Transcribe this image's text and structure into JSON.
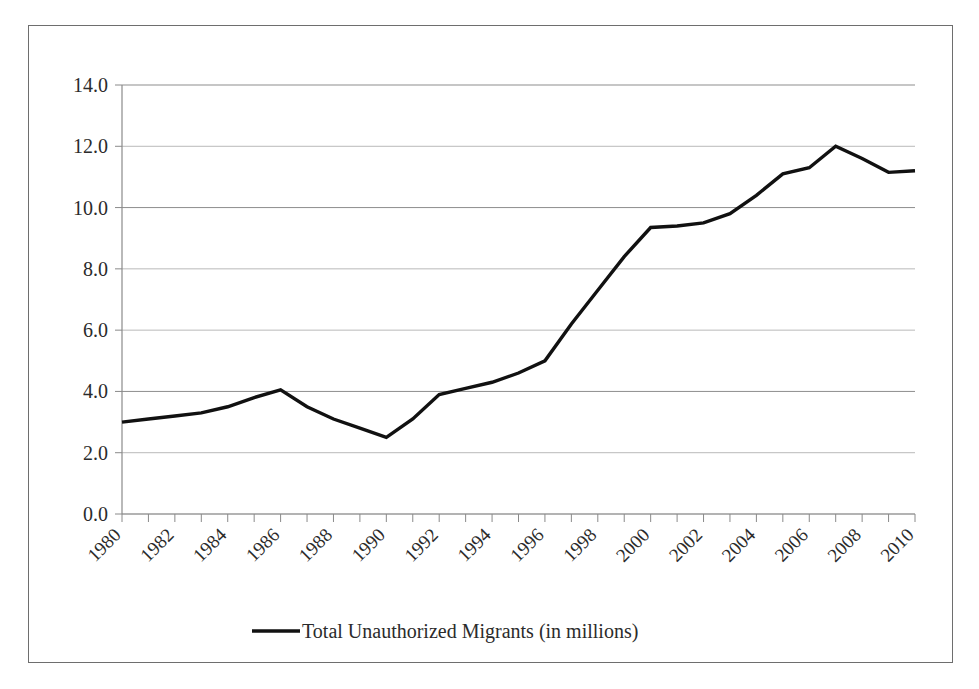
{
  "figure": {
    "background_color": "#ffffff",
    "border_color": "#6e6e6e",
    "line_color": "#111111",
    "gridline_color": "#b9b9b9"
  },
  "legend": {
    "position": "bottom-center",
    "entries": [
      {
        "label": "Total Unauthorized Migrants (in millions)",
        "marker": "line-swatch",
        "color": "#111111"
      }
    ]
  },
  "axes": {
    "y_tick_labels": [
      "0.0",
      "2.0",
      "4.0",
      "6.0",
      "8.0",
      "10.0",
      "12.0",
      "14.0"
    ],
    "x_tick_labels": [
      "1980",
      "1982",
      "1984",
      "1986",
      "1988",
      "1990",
      "1992",
      "1994",
      "1996",
      "1998",
      "2000",
      "2002",
      "2004",
      "2006",
      "2008",
      "2010"
    ]
  },
  "chart_data": {
    "type": "line",
    "title": "",
    "subtitle": "",
    "xlabel": "",
    "ylabel": "",
    "xlim": [
      1980,
      2010
    ],
    "ylim": [
      0.0,
      14.0
    ],
    "y_tick_step": 2.0,
    "x_tick_step_labeled": 2,
    "x_tick_step_minor": 1,
    "grid": true,
    "grid_axis": "y",
    "legend_position": "bottom",
    "x": [
      1980,
      1981,
      1982,
      1983,
      1984,
      1985,
      1986,
      1987,
      1988,
      1989,
      1990,
      1991,
      1992,
      1993,
      1994,
      1995,
      1996,
      1997,
      1998,
      1999,
      2000,
      2001,
      2002,
      2003,
      2004,
      2005,
      2006,
      2007,
      2008,
      2009,
      2010
    ],
    "series": [
      {
        "name": "Total Unauthorized Migrants (in millions)",
        "color": "#111111",
        "values": [
          3.0,
          3.1,
          3.2,
          3.3,
          3.5,
          3.8,
          4.05,
          3.5,
          3.1,
          2.8,
          2.5,
          3.1,
          3.9,
          4.1,
          4.3,
          4.6,
          5.0,
          6.2,
          7.3,
          8.4,
          9.35,
          9.4,
          9.5,
          9.8,
          10.4,
          11.1,
          11.3,
          12.0,
          11.6,
          11.15,
          11.2
        ]
      }
    ],
    "annotations": []
  }
}
